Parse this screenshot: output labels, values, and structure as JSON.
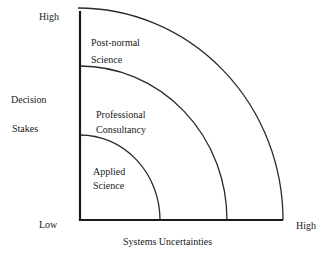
{
  "diagram": {
    "y_axis": {
      "label_line1": "Decision",
      "label_line2": "Stakes",
      "high": "High",
      "low": "Low"
    },
    "x_axis": {
      "label": "Systems Uncertainties",
      "high": "High"
    },
    "regions": [
      {
        "line1": "Applied",
        "line2": "Science"
      },
      {
        "line1": "Professional",
        "line2": "Consultancy"
      },
      {
        "line1": "Post-normal",
        "line2": "Science"
      }
    ],
    "colors": {
      "line": "#2a2a2a",
      "background": "#ffffff"
    }
  }
}
